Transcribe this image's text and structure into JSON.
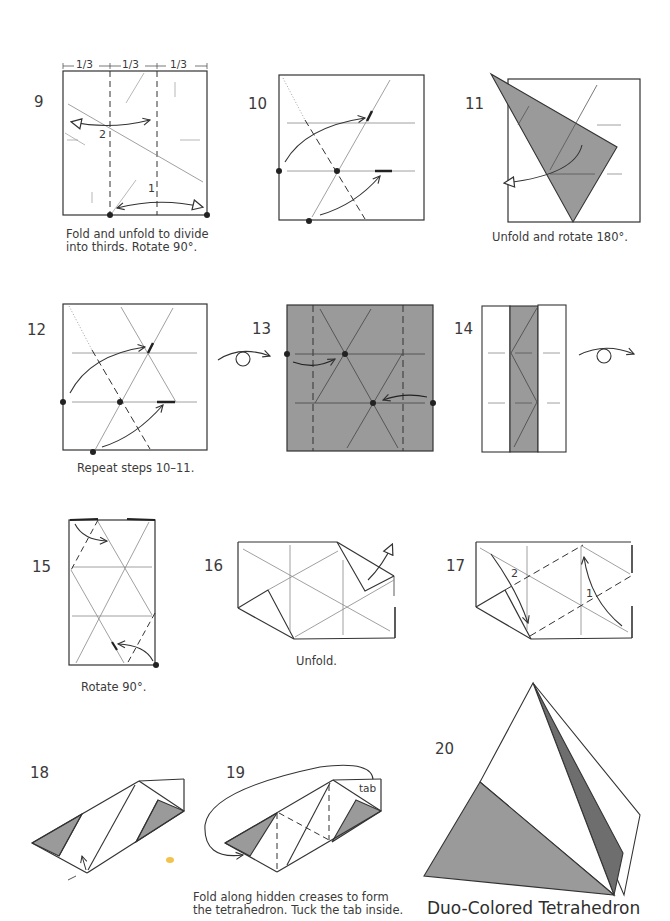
{
  "page": {
    "title": "Duo-Colored Tetrahedron",
    "colors": {
      "paper_white": "#ffffff",
      "paper_colored": "#9a9a9a",
      "paper_dark": "#6e6e6e",
      "line": "#333333",
      "crease": "#888888"
    }
  },
  "steps": [
    {
      "number": "9",
      "caption": "Fold and unfold to divide into thirds. Rotate 90°.",
      "caption_line1": "Fold and unfold to divide",
      "caption_line2": "into thirds. Rotate 90°.",
      "labels": {
        "thirds": [
          "1/3",
          "1/3",
          "1/3"
        ],
        "sub1": "1",
        "sub2": "2"
      }
    },
    {
      "number": "10",
      "caption": ""
    },
    {
      "number": "11",
      "caption": "Unfold and rotate 180°."
    },
    {
      "number": "12",
      "caption": "Repeat steps 10–11."
    },
    {
      "number": "13",
      "caption": ""
    },
    {
      "number": "14",
      "caption": ""
    },
    {
      "number": "15",
      "caption": "Rotate 90°."
    },
    {
      "number": "16",
      "caption": "Unfold."
    },
    {
      "number": "17",
      "caption": "",
      "labels": {
        "sub1": "1",
        "sub2": "2"
      }
    },
    {
      "number": "18",
      "caption": ""
    },
    {
      "number": "19",
      "caption": "Fold along hidden creases to form the tetrahedron. Tuck the tab inside.",
      "caption_line1": "Fold along hidden creases to form",
      "caption_line2": "the tetrahedron. Tuck the tab inside.",
      "labels": {
        "tab": "tab"
      }
    },
    {
      "number": "20",
      "caption": "Duo-Colored Tetrahedron"
    }
  ],
  "icons": [
    "turn-over-icon",
    "turn-over-icon",
    "fold-arrow-icon",
    "unfold-arrow-icon",
    "reference-dot-icon"
  ]
}
